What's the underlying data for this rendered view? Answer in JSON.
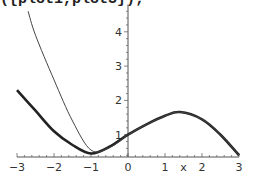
{
  "command_text": "({plot1,plot3});",
  "chart_data": {
    "type": "line",
    "title": "",
    "xlabel": "x",
    "ylabel": "",
    "xlim": [
      -3,
      3
    ],
    "ylim": [
      0.35,
      4.8
    ],
    "x_ticks": [
      "-3",
      "-2",
      "-1",
      "0",
      "1",
      "2",
      "3"
    ],
    "y_ticks": [
      "1",
      "2",
      "3",
      "4"
    ],
    "grid": false,
    "legend": null,
    "series": [
      {
        "name": "plot1 (thick)",
        "color": "#222222",
        "x": [
          -3,
          -2.5,
          -2,
          -1.5,
          -1,
          -0.5,
          0,
          0.5,
          1,
          1.4,
          2,
          2.5,
          3
        ],
        "y": [
          2.3,
          1.7,
          1.1,
          0.7,
          0.45,
          0.65,
          1.0,
          1.3,
          1.55,
          1.66,
          1.45,
          1.0,
          0.4
        ]
      },
      {
        "name": "plot3 (thin)",
        "color": "#444444",
        "x": [
          -2.7,
          -2.5,
          -2,
          -1.5,
          -1,
          -0.5,
          0,
          0.5,
          1,
          1.4,
          2,
          2.5,
          3
        ],
        "y": [
          4.6,
          3.9,
          2.6,
          1.4,
          0.55,
          0.62,
          1.0,
          1.3,
          1.55,
          1.66,
          1.45,
          1.0,
          0.4
        ]
      }
    ]
  }
}
